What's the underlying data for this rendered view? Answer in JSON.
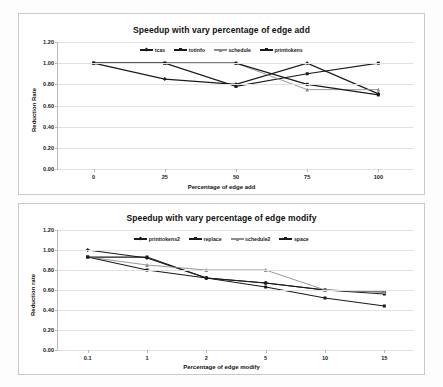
{
  "chart_data": [
    {
      "type": "line",
      "title": "Speedup with vary percentage of edge add",
      "xlabel": "Percentage of edge add",
      "ylabel": "Reduction Rate",
      "x": [
        0,
        25,
        50,
        75,
        100
      ],
      "xticks": [
        "0",
        "25",
        "50",
        "75",
        "100"
      ],
      "yticks": [
        "0.00",
        "0.20",
        "0.40",
        "0.60",
        "0.80",
        "1.00",
        "1.20"
      ],
      "ylim": [
        0.0,
        1.2
      ],
      "grid": true,
      "legend_position": "top-center",
      "series": [
        {
          "name": "tcas",
          "values": [
            1.0,
            0.85,
            0.8,
            1.0,
            0.71
          ],
          "color": "#1b1b1b",
          "marker": "diamond"
        },
        {
          "name": "totinfo",
          "values": [
            1.0,
            1.0,
            0.78,
            0.9,
            1.0
          ],
          "color": "#1b1b1b",
          "marker": "square"
        },
        {
          "name": "schedule",
          "values": [
            1.0,
            1.0,
            1.0,
            0.75,
            0.75
          ],
          "color": "#8d8d8d",
          "marker": "triangle"
        },
        {
          "name": "printtokens",
          "values": [
            1.0,
            1.0,
            1.0,
            0.8,
            0.7
          ],
          "color": "#1b1b1b",
          "marker": "square"
        }
      ]
    },
    {
      "type": "line",
      "title": "Speedup with vary percentage of edge modify",
      "xlabel": "Percentage of edge modify",
      "ylabel": "Reduction rate",
      "x": [
        0.1,
        1,
        2,
        5,
        10,
        15
      ],
      "xticks": [
        "0.1",
        "1",
        "2",
        "5",
        "10",
        "15"
      ],
      "yticks": [
        "0.00",
        "0.20",
        "0.40",
        "0.60",
        "0.80",
        "1.00",
        "1.20"
      ],
      "ylim": [
        0.0,
        1.2
      ],
      "grid": true,
      "legend_position": "top-center",
      "series": [
        {
          "name": "printtokens2",
          "values": [
            1.0,
            0.92,
            0.72,
            0.67,
            0.6,
            0.58
          ],
          "color": "#1b1b1b",
          "marker": "diamond"
        },
        {
          "name": "replace",
          "values": [
            0.93,
            0.93,
            0.72,
            0.67,
            0.6,
            0.56
          ],
          "color": "#1b1b1b",
          "marker": "square"
        },
        {
          "name": "schedule2",
          "values": [
            0.93,
            0.85,
            0.8,
            0.8,
            0.6,
            0.58
          ],
          "color": "#8d8d8d",
          "marker": "triangle"
        },
        {
          "name": "space",
          "values": [
            0.93,
            0.8,
            0.72,
            0.63,
            0.52,
            0.44
          ],
          "color": "#1b1b1b",
          "marker": "square"
        }
      ]
    }
  ]
}
